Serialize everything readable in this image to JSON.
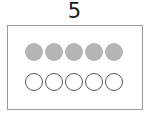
{
  "title": {
    "number": "5"
  },
  "frame": {
    "filled_count": 5,
    "empty_count": 5,
    "filled_color": "#b5b5b5",
    "empty_stroke_color": "#555555",
    "rows": [
      {
        "type": "filled",
        "dots": [
          "filled",
          "filled",
          "filled",
          "filled",
          "filled"
        ]
      },
      {
        "type": "empty",
        "dots": [
          "empty",
          "empty",
          "empty",
          "empty",
          "empty"
        ]
      }
    ]
  }
}
